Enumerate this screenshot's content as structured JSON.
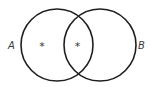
{
  "diagram": {
    "type": "venn",
    "stroke_color": "#1e1e1e",
    "sets": [
      {
        "label": "A",
        "cx": 57,
        "cy": 45,
        "r": 36
      },
      {
        "label": "B",
        "cx": 100,
        "cy": 45,
        "r": 36
      }
    ],
    "markers": [
      {
        "symbol": "*",
        "region": "A only"
      },
      {
        "symbol": "*",
        "region": "A and B"
      }
    ]
  }
}
